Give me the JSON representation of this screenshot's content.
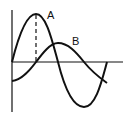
{
  "diagram": {
    "title": "",
    "labels": {
      "curve_a": "A",
      "curve_b": "B"
    },
    "colors": {
      "stroke": "#111111",
      "background": "#ffffff"
    },
    "axes": {
      "horizontal": true,
      "vertical": true
    },
    "curves": [
      {
        "name": "A",
        "shape": "sine",
        "phase": "leads by quarter period"
      },
      {
        "name": "B",
        "shape": "sine",
        "phase": "lags by quarter period"
      }
    ],
    "marker": "dashed vertical line from peak of A to horizontal axis"
  }
}
